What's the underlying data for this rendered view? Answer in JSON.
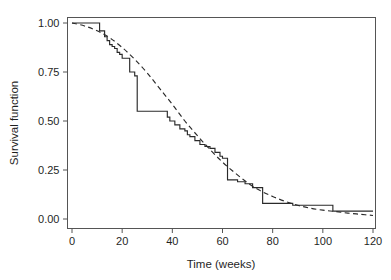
{
  "chart_data": {
    "type": "line",
    "title": "",
    "subtitle": "",
    "xlabel": "Time (weeks)",
    "ylabel": "Survival function",
    "xlim": [
      0,
      124
    ],
    "ylim": [
      0.0,
      1.035
    ],
    "xticks": [
      0,
      20,
      40,
      60,
      80,
      100,
      120
    ],
    "xticklabels": [
      "0",
      "20",
      "40",
      "60",
      "80",
      "100",
      "120"
    ],
    "yticks": [
      0.0,
      0.25,
      0.5,
      0.75,
      1.0
    ],
    "yticklabels": [
      "0.00",
      "0.25",
      "0.50",
      "0.75",
      "1.00"
    ],
    "grid": false,
    "legend": false,
    "legend_position": "none",
    "frame": "box",
    "series": [
      {
        "name": "Kaplan-Meier estimate",
        "style": "step-post",
        "linestyle": "solid",
        "color": "#2a2a2a",
        "x": [
          0,
          10,
          11,
          13,
          14,
          15,
          16,
          17,
          18,
          19,
          20,
          23,
          25,
          26,
          36,
          38,
          39,
          41,
          43,
          45,
          46,
          47,
          49,
          51,
          53,
          55,
          57,
          59,
          60,
          62,
          66,
          69,
          72,
          76,
          88,
          104,
          120
        ],
        "y": [
          1.0,
          1.0,
          0.96,
          0.93,
          0.91,
          0.89,
          0.88,
          0.87,
          0.85,
          0.84,
          0.82,
          0.75,
          0.73,
          0.55,
          0.55,
          0.52,
          0.5,
          0.48,
          0.46,
          0.45,
          0.43,
          0.42,
          0.4,
          0.38,
          0.37,
          0.36,
          0.34,
          0.32,
          0.31,
          0.2,
          0.19,
          0.18,
          0.16,
          0.08,
          0.07,
          0.04,
          0.04
        ]
      },
      {
        "name": "Fitted parametric survival curve",
        "style": "smooth",
        "linestyle": "dashed",
        "color": "#2a2a2a",
        "x": [
          0,
          5,
          10,
          15,
          20,
          25,
          30,
          35,
          40,
          45,
          50,
          55,
          60,
          65,
          70,
          75,
          80,
          85,
          90,
          95,
          100,
          105,
          110,
          115,
          120
        ],
        "y": [
          1.0,
          0.985,
          0.96,
          0.925,
          0.875,
          0.815,
          0.745,
          0.665,
          0.585,
          0.5,
          0.425,
          0.355,
          0.29,
          0.235,
          0.185,
          0.145,
          0.115,
          0.09,
          0.07,
          0.055,
          0.045,
          0.038,
          0.03,
          0.024,
          0.018
        ]
      }
    ],
    "annotations": []
  }
}
